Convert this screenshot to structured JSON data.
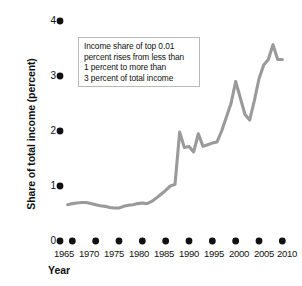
{
  "chart_data": {
    "type": "line",
    "title": "",
    "xlabel": "Year",
    "ylabel": "Share of total income (percent)",
    "xlim": [
      1963,
      2011
    ],
    "ylim": [
      0,
      4
    ],
    "grid": false,
    "legend": "none",
    "line_color": "#9a9a9a",
    "series": [
      {
        "name": "Income share of top 0.01 percent",
        "x": [
          1964,
          1965,
          1966,
          1967,
          1968,
          1969,
          1970,
          1971,
          1972,
          1973,
          1974,
          1975,
          1976,
          1977,
          1978,
          1979,
          1980,
          1981,
          1982,
          1983,
          1984,
          1985,
          1986,
          1987,
          1988,
          1989,
          1990,
          1991,
          1992,
          1993,
          1994,
          1995,
          1996,
          1997,
          1998,
          1999,
          2000,
          2001,
          2002,
          2003,
          2004,
          2005,
          2006,
          2007,
          2008,
          2009,
          2010
        ],
        "values": [
          0.66,
          0.68,
          0.69,
          0.7,
          0.7,
          0.68,
          0.66,
          0.64,
          0.63,
          0.61,
          0.6,
          0.6,
          0.63,
          0.65,
          0.66,
          0.68,
          0.69,
          0.68,
          0.72,
          0.78,
          0.85,
          0.92,
          1.0,
          1.03,
          1.98,
          1.7,
          1.72,
          1.62,
          1.95,
          1.72,
          1.75,
          1.78,
          1.8,
          2.0,
          2.25,
          2.5,
          2.9,
          2.6,
          2.3,
          2.2,
          2.55,
          2.95,
          3.2,
          3.3,
          3.57,
          3.3,
          3.3
        ]
      }
    ],
    "yticks": [
      0,
      1,
      2,
      3,
      4
    ],
    "ytick_labels": [
      "0",
      "1",
      "2",
      "3",
      "4"
    ],
    "xticks": [
      1965,
      1970,
      1975,
      1980,
      1985,
      1990,
      1995,
      2000,
      2005,
      2010
    ],
    "xtick_labels": [
      "1965",
      "1970",
      "1975",
      "1980",
      "1985",
      "1990",
      "1995",
      "2000",
      "2005",
      "2010"
    ],
    "annotations": [
      "Income share of top 0.01",
      "percent rises from less than",
      "1 percent to more than",
      "3 percent of total income"
    ]
  }
}
